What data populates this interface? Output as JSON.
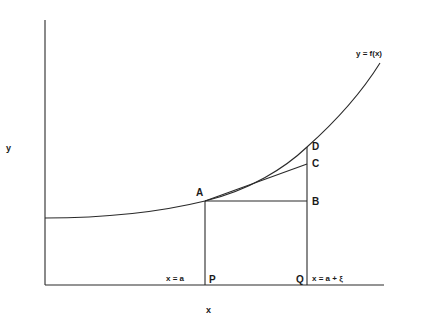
{
  "diagram": {
    "title": "",
    "axes": {
      "x_label": "x",
      "y_label": "y"
    },
    "curve": {
      "label": "y = f(x)"
    },
    "points": {
      "A": "A",
      "B": "B",
      "C": "C",
      "D": "D",
      "P": "P",
      "Q": "Q"
    },
    "vertical_labels": {
      "at_P": "x = a",
      "at_Q": "x = a + ξ"
    },
    "colors": {
      "stroke": "#2a2a2a",
      "background": "#ffffff"
    }
  }
}
